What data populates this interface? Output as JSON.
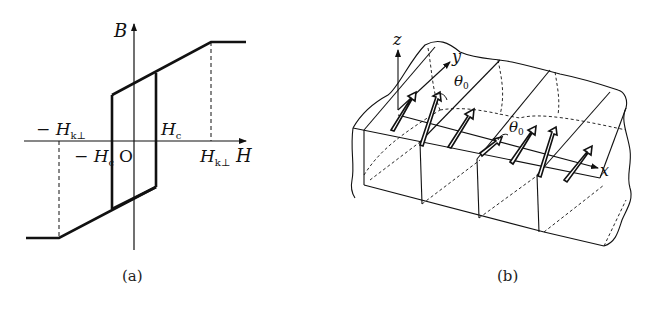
{
  "figure_a": {
    "caption": "(a)",
    "axis_y_label": "B",
    "axis_x_label": "H",
    "origin_label": "O",
    "labels": {
      "neg_hk": "− H",
      "neg_hk_sub": "k⊥",
      "hc": "H",
      "hc_sub": "c",
      "neg_hc": "− H",
      "neg_hc_sub": "c",
      "hk": "H",
      "hk_sub": "k⊥"
    },
    "description": "Hysteresis loop B vs H with coercive field Hc and perpendicular anisotropy field Hk⊥"
  },
  "figure_b": {
    "caption": "(b)",
    "axes": {
      "x": "x",
      "y": "y",
      "z": "z"
    },
    "angle_label_1": "θ",
    "angle_label_1_sub": "0",
    "angle_label_2": "θ",
    "angle_label_2_sub": "0",
    "description": "3D slab with magnetization arrows forming domain walls"
  }
}
